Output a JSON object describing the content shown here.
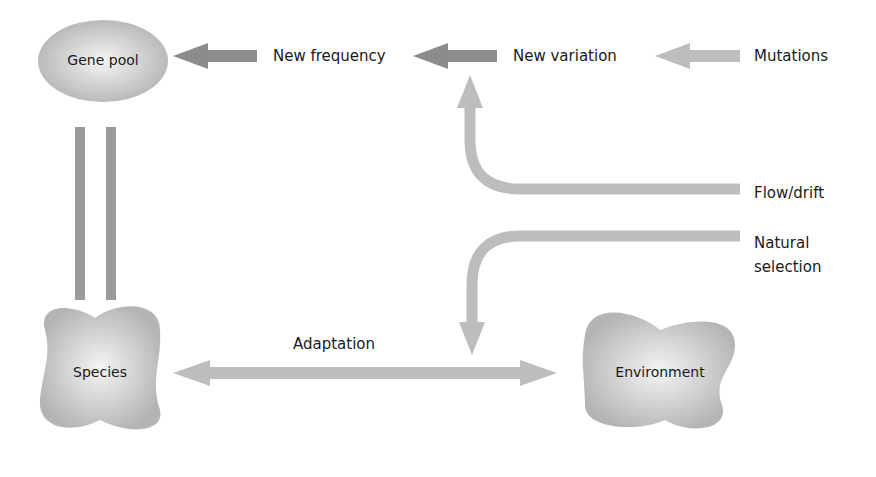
{
  "diagram": {
    "nodes": {
      "gene_pool": "Gene pool",
      "species": "Species",
      "environment": "Environment"
    },
    "labels": {
      "new_frequency": "New frequency",
      "new_variation": "New variation",
      "mutations": "Mutations",
      "flow_drift": "Flow/drift",
      "natural_selection_line1": "Natural",
      "natural_selection_line2": "selection",
      "adaptation": "Adaptation"
    },
    "colors": {
      "dark_arrow": "#8c8c8c",
      "light_arrow": "#bdbdbd",
      "node_fill": "#c8c8c8",
      "text": "#1a1a1a"
    },
    "edges": [
      {
        "from": "New frequency",
        "to": "Gene pool",
        "style": "dark"
      },
      {
        "from": "New variation",
        "to": "New frequency",
        "style": "dark"
      },
      {
        "from": "Mutations",
        "to": "New variation",
        "style": "light"
      },
      {
        "from": "Flow/drift",
        "to": "New variation",
        "style": "light"
      },
      {
        "from": "Natural selection",
        "to": "Adaptation",
        "style": "light"
      },
      {
        "from": "Species",
        "to": "Environment",
        "style": "light",
        "bidirectional": true,
        "label": "Adaptation"
      },
      {
        "from": "Gene pool",
        "to": "Species",
        "style": "dark",
        "type": "equivalence"
      }
    ]
  }
}
